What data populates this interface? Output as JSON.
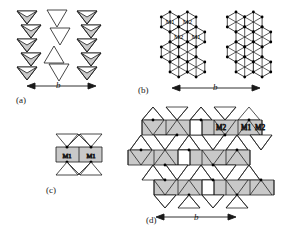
{
  "figure": {
    "background": "#ffffff",
    "line_color": "#1a1a1a",
    "fill_shaded": "#c9c9c9",
    "fill_open": "#ffffff"
  },
  "panels": [
    {
      "id": "a",
      "caption": "(a)",
      "axis_label": "b",
      "description": "chains of shaded down-pointing triangles flanking a column of open alternating triangles"
    },
    {
      "id": "b",
      "caption": "(b)",
      "axis_label": "b",
      "description": "two honeycomb clusters of triangulated hexagons with labelled octahedral sites",
      "site_labels": [
        "M1",
        "M2",
        "M2",
        "M1"
      ]
    },
    {
      "id": "c",
      "caption": "(c)",
      "axis_label": "",
      "description": "single shaded band with two M1 sites between open triangles",
      "site_labels": [
        "M1",
        "M1"
      ]
    },
    {
      "id": "d",
      "caption": "(d)",
      "axis_label": "b",
      "description": "extended framework of shaded bands and open triangles with labelled sites",
      "site_labels": [
        "M2",
        "M1",
        "M2"
      ]
    }
  ],
  "labels": {
    "a_caption": "(a)",
    "b_caption": "(b)",
    "c_caption": "(c)",
    "d_caption": "(d)",
    "a_axis": "b",
    "b_axis": "b",
    "d_axis": "b",
    "b_m1_top": "M1",
    "b_m2_top": "M2",
    "b_m2_low": "M2",
    "b_m1_low": "M1",
    "c_m1_left": "M1",
    "c_m1_right": "M1",
    "d_m2_left": "M2",
    "d_m1_mid": "M1",
    "d_m2_right": "M2"
  }
}
